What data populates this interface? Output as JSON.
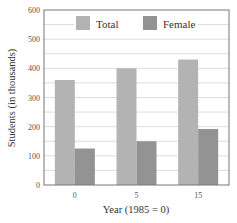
{
  "chart_data": {
    "type": "bar",
    "title": "",
    "xlabel": "Year (1985 = 0)",
    "ylabel": "Students (in thousands)",
    "categories": [
      "0",
      "5",
      "15"
    ],
    "series": [
      {
        "name": "Total",
        "values": [
          360,
          400,
          430
        ],
        "color": "#b3b3b3"
      },
      {
        "name": "Female",
        "values": [
          125,
          150,
          192
        ],
        "color": "#939393"
      }
    ],
    "ylim": [
      0,
      600
    ],
    "yticks": [
      0,
      100,
      200,
      300,
      400,
      500,
      600
    ],
    "minor_grid_step": 50,
    "grid": true,
    "legend_position": "top-inside"
  }
}
